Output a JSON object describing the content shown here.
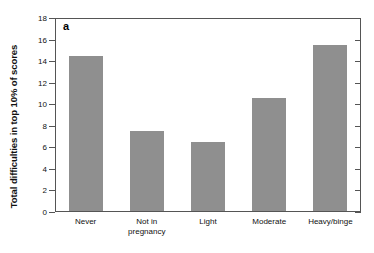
{
  "figure": {
    "panel_label": "a",
    "bar_color": "#8f8f8f",
    "axis_color": "#555555"
  },
  "chart_data": {
    "type": "bar",
    "title": "",
    "subtitle": "",
    "panel": "a",
    "categories": [
      "Never",
      "Not in pregnancy",
      "Light",
      "Moderate",
      "Heavy/binge"
    ],
    "category_lines": [
      [
        "Never"
      ],
      [
        "Not in",
        "pregnancy"
      ],
      [
        "Light"
      ],
      [
        "Moderate"
      ],
      [
        "Heavy/binge"
      ]
    ],
    "values": [
      14.5,
      7.5,
      6.5,
      10.6,
      15.5
    ],
    "xlabel": "",
    "ylabel": "Total difficulties in top 10% of scores",
    "ylim": [
      0,
      18
    ],
    "ytick_values": [
      0,
      2,
      4,
      6,
      8,
      10,
      12,
      14,
      16,
      18
    ],
    "ytick_labels": [
      "0",
      "2",
      "4",
      "6",
      "8",
      "10",
      "12",
      "14",
      "16",
      "18"
    ],
    "grid": false,
    "legend": false,
    "legend_position": "none"
  }
}
